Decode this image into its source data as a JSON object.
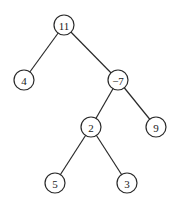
{
  "diagram": {
    "type": "binary-tree",
    "nodes": [
      {
        "id": "n11",
        "label": "11",
        "x": 64,
        "y": 25
      },
      {
        "id": "n4",
        "label": "4",
        "x": 24,
        "y": 80
      },
      {
        "id": "nm7",
        "label": "−7",
        "x": 118,
        "y": 80
      },
      {
        "id": "n2",
        "label": "2",
        "x": 91,
        "y": 127
      },
      {
        "id": "n9",
        "label": "9",
        "x": 156,
        "y": 127
      },
      {
        "id": "n5",
        "label": "5",
        "x": 55,
        "y": 183
      },
      {
        "id": "n3",
        "label": "3",
        "x": 127,
        "y": 183
      }
    ],
    "edges": [
      {
        "from": "n11",
        "to": "n4"
      },
      {
        "from": "n11",
        "to": "nm7"
      },
      {
        "from": "nm7",
        "to": "n2"
      },
      {
        "from": "nm7",
        "to": "n9"
      },
      {
        "from": "n2",
        "to": "n5"
      },
      {
        "from": "n2",
        "to": "n3"
      }
    ],
    "node_radius": 10
  }
}
